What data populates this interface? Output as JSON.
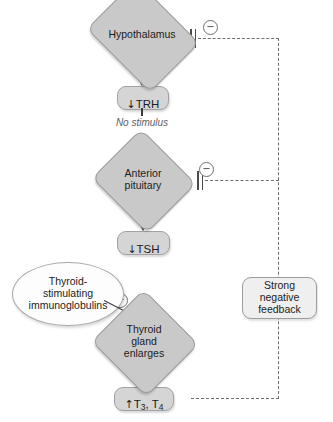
{
  "diagram": {
    "nodes": {
      "hypothalamus": {
        "label": "Hypothalamus",
        "shape": "diamond"
      },
      "trh": {
        "label": "TRH",
        "arrow": "↓",
        "shape": "rounded-box"
      },
      "no_stimulus": {
        "label": "No stimulus"
      },
      "anterior_pituitary": {
        "label": "Anterior\npituitary",
        "shape": "diamond"
      },
      "tsh": {
        "label": "TSH",
        "arrow": "↓",
        "shape": "rounded-box"
      },
      "immunoglobulins": {
        "label": "Thyroid-\nstimulating\nimmunoglobulins",
        "shape": "ellipse"
      },
      "thyroid_gland": {
        "label": "Thyroid\ngland\nenlarges",
        "shape": "diamond"
      },
      "hormones": {
        "arrow": "↑",
        "t3": "T",
        "t3_sub": "3",
        "sep": ", ",
        "t4": "T",
        "t4_sub": "4",
        "shape": "rounded-box"
      },
      "feedback": {
        "label": "Strong negative\nfeedback",
        "shape": "rounded-box"
      }
    },
    "signs": {
      "minus_hypothalamus": "−",
      "minus_pituitary": "−",
      "plus_immunoglobulins": "+"
    },
    "colors": {
      "diamond_fill": "#c9c9c9",
      "box_fill": "#d5d5d5",
      "light_box_fill": "#efefef",
      "ellipse_fill": "#fdfdfd",
      "stroke": "#3b3b3b",
      "dashed_stroke": "#6d6d6d",
      "text": "#1c1c1c",
      "caption_text": "#5d5d5d",
      "background": "#ffffff"
    }
  }
}
